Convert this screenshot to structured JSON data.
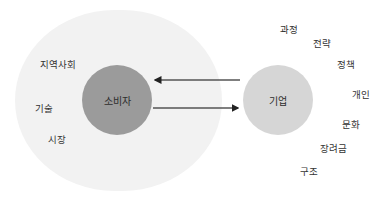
{
  "diagram": {
    "inner_circle_left": {
      "label": "소비자",
      "color": "#9b9b9b"
    },
    "inner_circle_right": {
      "label": "기업",
      "color": "#d6d6d6"
    },
    "background_region_color": "#f2f2f2",
    "arrows": [
      {
        "from": "기업",
        "to": "소비자",
        "direction": "left"
      },
      {
        "from": "소비자",
        "to": "기업",
        "direction": "right"
      }
    ],
    "left_labels": [
      "지역사회",
      "기술",
      "시장"
    ],
    "right_labels": [
      "과정",
      "전략",
      "정책",
      "개인",
      "문화",
      "장려금",
      "구조"
    ]
  }
}
